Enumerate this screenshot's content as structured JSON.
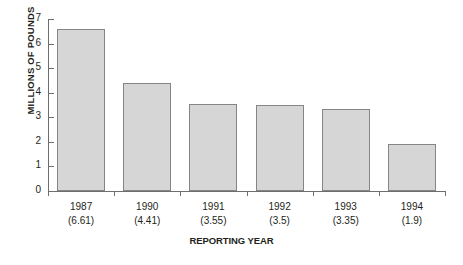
{
  "chart_data": {
    "type": "bar",
    "title": "",
    "xlabel": "REPORTING YEAR",
    "ylabel": "MILLIONS OF POUNDS",
    "categories": [
      "1987",
      "1990",
      "1991",
      "1992",
      "1993",
      "1994"
    ],
    "category_sublabels": [
      "(6.61)",
      "(4.41)",
      "(3.55)",
      "(3.5)",
      "(3.35)",
      "(1.9)"
    ],
    "values": [
      6.61,
      4.41,
      3.55,
      3.5,
      3.35,
      1.9
    ],
    "ylim": [
      0,
      7
    ],
    "yticks": [
      0,
      1,
      2,
      3,
      4,
      5,
      6,
      7
    ],
    "ytick_labels": [
      "0",
      "1",
      "2",
      "3",
      "4",
      "5",
      "6",
      "7"
    ],
    "grid": false,
    "legend": null,
    "bar_fill_color": "#d6d6d6",
    "bar_border_color": "#858585",
    "axis_color": "#6e6e6e",
    "text_color": "#231f20",
    "background_color": "#ffffff"
  }
}
